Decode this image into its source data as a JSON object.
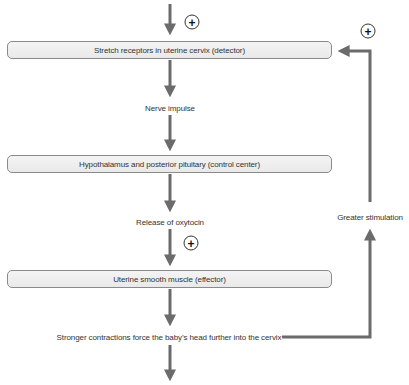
{
  "diagram": {
    "type": "positive-feedback-loop",
    "boxes": [
      {
        "label": "Stretch receptors in uterine cervix (detector)"
      },
      {
        "label": "Hypothalamus and posterior pituitary (control center)"
      },
      {
        "label": "Uterine smooth muscle (effector)"
      }
    ],
    "labels": {
      "nerve_impulse": "Nerve impulse",
      "release_oxytocin": "Release of oxytocin",
      "stronger_contractions": "Stronger contractions force the baby’s head further into the cervix",
      "greater_stimulation": "Greater stimulation"
    },
    "plus_signs": [
      "+",
      "+",
      "+"
    ],
    "colors": {
      "arrow": "#6b6b6b",
      "box_border": "#8a8a8a",
      "box_fill": "#efefef",
      "text": "#333333"
    }
  }
}
